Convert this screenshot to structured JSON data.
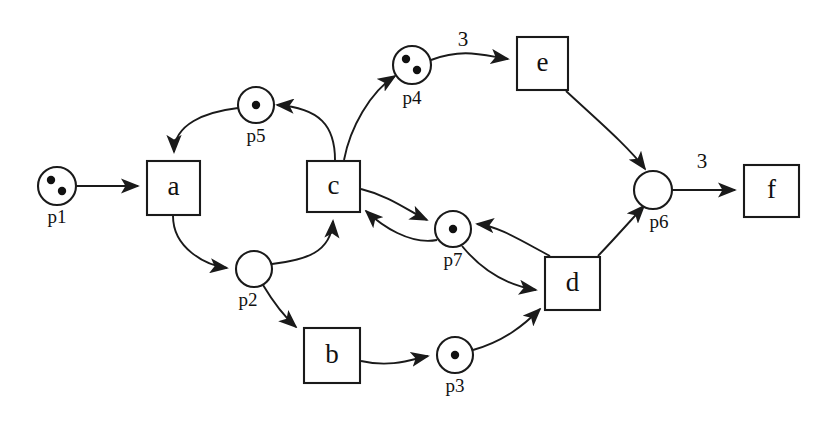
{
  "diagram": {
    "type": "petri-net",
    "title": "",
    "background_color": "#ffffff",
    "line_color": "#1a1a1a",
    "token_color": "#111111"
  },
  "places": [
    {
      "id": "p1",
      "label": "p1",
      "cx": 57,
      "cy": 186,
      "r": 19,
      "tokens": 2,
      "token_positions": [
        [
          -6,
          -6
        ],
        [
          5,
          5
        ]
      ],
      "label_x": 57,
      "label_y": 219
    },
    {
      "id": "p2",
      "label": "p2",
      "cx": 254,
      "cy": 269,
      "r": 18,
      "tokens": 0,
      "token_positions": [],
      "label_x": 248,
      "label_y": 302
    },
    {
      "id": "p3",
      "label": "p3",
      "cx": 455,
      "cy": 355,
      "r": 18,
      "tokens": 1,
      "token_positions": [
        [
          0,
          0
        ]
      ],
      "label_x": 455,
      "label_y": 388
    },
    {
      "id": "p4",
      "label": "p4",
      "cx": 412,
      "cy": 65,
      "r": 19,
      "tokens": 2,
      "token_positions": [
        [
          -6,
          -6
        ],
        [
          5,
          5
        ]
      ],
      "label_x": 412,
      "label_y": 100
    },
    {
      "id": "p5",
      "label": "p5",
      "cx": 256,
      "cy": 105,
      "r": 18,
      "tokens": 1,
      "token_positions": [
        [
          0,
          0
        ]
      ],
      "label_x": 256,
      "label_y": 138
    },
    {
      "id": "p6",
      "label": "p6",
      "cx": 653,
      "cy": 190,
      "r": 19,
      "tokens": 0,
      "token_positions": [],
      "label_x": 659,
      "label_y": 224
    },
    {
      "id": "p7",
      "label": "p7",
      "cx": 453,
      "cy": 229,
      "r": 18,
      "tokens": 1,
      "token_positions": [
        [
          0,
          0
        ]
      ],
      "label_x": 453,
      "label_y": 262
    }
  ],
  "transitions": [
    {
      "id": "a",
      "label": "a",
      "x": 147,
      "y": 161,
      "w": 53,
      "h": 54
    },
    {
      "id": "b",
      "label": "b",
      "x": 304,
      "y": 328,
      "w": 56,
      "h": 55
    },
    {
      "id": "c",
      "label": "c",
      "x": 307,
      "y": 161,
      "w": 53,
      "h": 51
    },
    {
      "id": "d",
      "label": "d",
      "x": 545,
      "y": 257,
      "w": 55,
      "h": 53
    },
    {
      "id": "e",
      "label": "e",
      "x": 517,
      "y": 37,
      "w": 51,
      "h": 53
    },
    {
      "id": "f",
      "label": "f",
      "x": 744,
      "y": 165,
      "w": 55,
      "h": 52
    }
  ],
  "arcs": [
    {
      "id": "p1-a",
      "from": "p1",
      "to": "a",
      "weight": "",
      "path": "M 77 186 L 138 186"
    },
    {
      "id": "a-p2",
      "from": "a",
      "to": "p2",
      "weight": "",
      "path": "M 173 216 C 173 248 205 265 227 268"
    },
    {
      "id": "p5-a",
      "from": "p5",
      "to": "a",
      "weight": "",
      "path": "M 238 108 C 205 112 174 124 174 152"
    },
    {
      "id": "p2-c",
      "from": "p2",
      "to": "c",
      "weight": "",
      "path": "M 272 264 C 305 260 331 253 333 221"
    },
    {
      "id": "p2-b",
      "from": "p2",
      "to": "b",
      "weight": "",
      "path": "M 263 285 C 275 305 287 319 296 327"
    },
    {
      "id": "b-p3",
      "from": "b",
      "to": "p3",
      "weight": "",
      "path": "M 361 361 C 392 368 413 359 428 356"
    },
    {
      "id": "p3-d",
      "from": "p3",
      "to": "d",
      "weight": "",
      "path": "M 473 350 C 505 341 525 324 540 309"
    },
    {
      "id": "c-p5",
      "from": "c",
      "to": "p5",
      "weight": "",
      "path": "M 335 160 C 335 126 320 108 277 105"
    },
    {
      "id": "c-p4",
      "from": "c",
      "to": "p4",
      "weight": "",
      "path": "M 344 160 C 350 128 370 92 395 76"
    },
    {
      "id": "p4-e",
      "from": "p4",
      "to": "e",
      "weight": "3",
      "weight_x": 463,
      "weight_y": 41,
      "path": "M 431 60 C 463 48 482 55 508 59"
    },
    {
      "id": "e-p6",
      "from": "e",
      "to": "p6",
      "weight": "",
      "path": "M 566 91 C 595 118 629 147 645 169"
    },
    {
      "id": "c-p7",
      "from": "c",
      "to": "p7",
      "weight": "",
      "path": "M 361 189 C 390 196 410 212 427 220"
    },
    {
      "id": "p7-c",
      "from": "p7",
      "to": "c",
      "weight": "",
      "path": "M 437 240 C 410 245 382 226 366 211"
    },
    {
      "id": "d-p7",
      "from": "d",
      "to": "p7",
      "weight": "",
      "path": "M 550 256 C 520 240 498 226 477 224"
    },
    {
      "id": "p7-d",
      "from": "p7",
      "to": "d",
      "weight": "",
      "path": "M 462 246 C 480 268 505 285 536 290"
    },
    {
      "id": "d-p6",
      "from": "d",
      "to": "p6",
      "weight": "",
      "path": "M 598 256 C 618 235 631 220 644 206"
    },
    {
      "id": "p6-f",
      "from": "p6",
      "to": "f",
      "weight": "3",
      "weight_x": 702,
      "weight_y": 163,
      "path": "M 673 190 L 735 190"
    }
  ]
}
